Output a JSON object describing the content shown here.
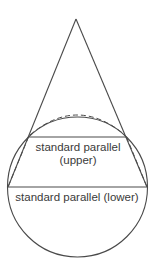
{
  "diagram": {
    "type": "conic-projection-secant",
    "labels": {
      "upper_line1": "standard parallel",
      "upper_line2": "(upper)",
      "lower": "standard parallel (lower)"
    },
    "colors": {
      "stroke": "#4a4a4a",
      "text": "#3a3a3a",
      "background": "#ffffff"
    }
  }
}
